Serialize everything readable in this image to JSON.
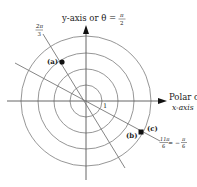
{
  "diagram": {
    "type": "polar-coordinate-plane",
    "center": [
      86,
      101
    ],
    "circle_radii": [
      16,
      32,
      48,
      65
    ],
    "colors": {
      "line": "#8a8a8a",
      "axis": "#555555",
      "ink": "#111111"
    },
    "axes": {
      "y_label": "y-axis or θ = ",
      "y_frac_num": "π",
      "y_frac_den": "2",
      "x_label_line1": "Polar or",
      "x_label_line2": "x-axis"
    },
    "rays": [
      {
        "angle_label_num": "2π",
        "angle_label_den": "3"
      },
      {
        "angle_label_num": "11π",
        "angle_label_den": "6",
        "equals": " = −",
        "alt_num": "π",
        "alt_den": "6"
      }
    ],
    "unit_label": "1",
    "points": [
      {
        "label": "(a)"
      },
      {
        "label": "(b)"
      },
      {
        "label": "(c)"
      }
    ]
  }
}
